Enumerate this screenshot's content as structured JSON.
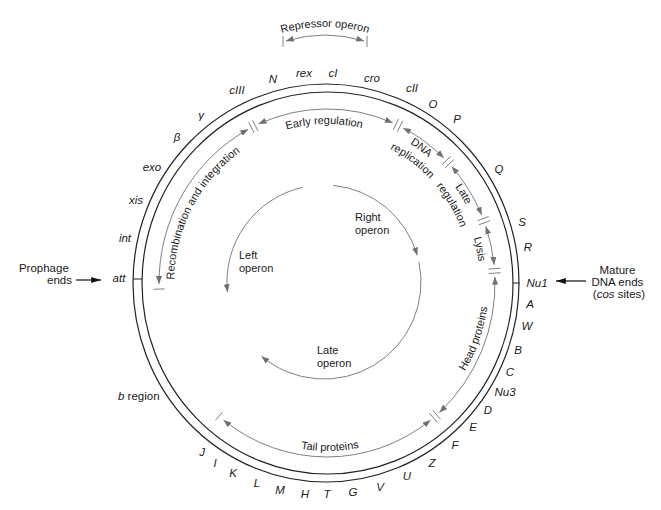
{
  "repressor_operon": {
    "label": "Repressor operon"
  },
  "genes": [
    "N",
    "rex",
    "cI",
    "cro",
    "cII",
    "O",
    "P",
    "Q",
    "S",
    "R",
    "Nu1",
    "A",
    "W",
    "B",
    "C",
    "Nu3",
    "D",
    "E",
    "F",
    "Z",
    "U",
    "V",
    "G",
    "T",
    "H",
    "M",
    "L",
    "K",
    "I",
    "J",
    "att",
    "int",
    "xis",
    "exo",
    "β",
    "γ",
    "cIII"
  ],
  "b_region": {
    "italic": "b",
    "text": " region"
  },
  "prophage_ends": {
    "line1": "Prophage",
    "line2": "ends"
  },
  "mature_dna_ends": {
    "line1": "Mature",
    "line2": "DNA ends",
    "line3_open": "(",
    "line3_italic": "cos",
    "line3_close": " sites)"
  },
  "functional_regions": {
    "recombination": "Recombination and integration",
    "early_regulation": "Early regulation",
    "dna_replication": {
      "line1": "DNA",
      "line2": "replication"
    },
    "late_regulation": {
      "line1": "Late",
      "line2": "regulation"
    },
    "lysis": "Lysis",
    "head_proteins": "Head proteins",
    "tail_proteins": "Tail proteins"
  },
  "operons": {
    "left": {
      "line1": "Left",
      "line2": "operon"
    },
    "right": {
      "line1": "Right",
      "line2": "operon"
    },
    "late": {
      "line1": "Late",
      "line2": "operon"
    }
  },
  "colors": {
    "map_line": "#222222",
    "region_arrow": "#808080",
    "operon_arrow": "#808080",
    "text": "#1a1a1a"
  }
}
